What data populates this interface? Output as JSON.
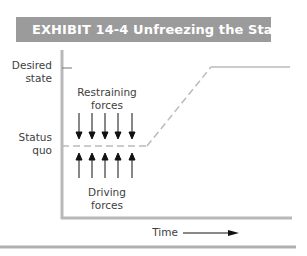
{
  "exhibit": {
    "title": "EXHIBIT 14-4  Unfreezing the Status Quo",
    "header_color": "#9b9b9b"
  },
  "diagram": {
    "y_axis_labels": {
      "desired_state": "Desired state",
      "desired_state_line1": "Desired",
      "desired_state_line2": "state",
      "status_quo": "Status quo",
      "status_quo_line1": "Status",
      "status_quo_line2": "quo"
    },
    "restraining_forces": {
      "label_line1": "Restraining",
      "label_line2": "forces",
      "arrow_count": 5,
      "direction": "down"
    },
    "driving_forces": {
      "label_line1": "Driving",
      "label_line2": "forces",
      "arrow_count": 5,
      "direction": "up"
    },
    "x_axis_label": "Time",
    "path": {
      "segments": [
        "status quo (dashed)",
        "transition (dashed, rising)",
        "desired state (solid)"
      ]
    }
  }
}
